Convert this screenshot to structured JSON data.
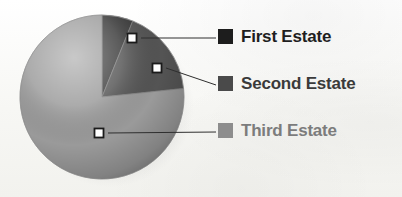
{
  "figure": {
    "background_color": "#fbfbf9",
    "kind": "pie-chart-with-legend"
  },
  "legend": {
    "position": "right",
    "items": [
      {
        "label": "First Estate",
        "color": "#1d1d1d",
        "text_color": "#1f1f1f"
      },
      {
        "label": "Second Estate",
        "color": "#4a4a4a",
        "text_color": "#3a3a3a"
      },
      {
        "label": "Third Estate",
        "color": "#8d8d8d",
        "text_color": "#7c7c7c"
      }
    ]
  },
  "chart_data": {
    "type": "pie",
    "title": "",
    "subtitle": "",
    "xlabel": "",
    "ylabel": "",
    "legend_position": "right",
    "grid": false,
    "labels": [
      "First Estate",
      "Second Estate",
      "Third Estate"
    ],
    "values": [
      6,
      17,
      77
    ],
    "units": "percent",
    "colors": [
      "#3a3a3a",
      "#545454",
      "#9a9a9a"
    ],
    "start_angle_deg": -90,
    "direction": "clockwise",
    "slices": [
      {
        "label": "First Estate",
        "value": 6,
        "color": "#3a3a3a",
        "start_deg": -90,
        "end_deg": -68
      },
      {
        "label": "Second Estate",
        "value": 17,
        "color": "#545454",
        "start_deg": -68,
        "end_deg": -6
      },
      {
        "label": "Third Estate",
        "value": 77,
        "color": "#9a9a9a",
        "start_deg": -6,
        "end_deg": 270
      }
    ],
    "annotations": [
      {
        "label": "First Estate",
        "marker_x": 132,
        "marker_y": 38,
        "leader_to_x": 216,
        "leader_to_y": 38
      },
      {
        "label": "Second Estate",
        "marker_x": 157,
        "marker_y": 68,
        "leader_to_x": 216,
        "leader_to_y": 85
      },
      {
        "label": "Third Estate",
        "marker_x": 99,
        "marker_y": 133,
        "leader_to_x": 216,
        "leader_to_y": 132
      }
    ]
  },
  "pie_geometry": {
    "center_x": 102,
    "center_y": 97,
    "radius": 82,
    "shadow": true,
    "shading": "3d-sphere"
  }
}
